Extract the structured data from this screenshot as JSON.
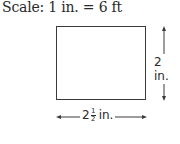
{
  "scale": {
    "text": "Scale: 1 in. = 6 ft"
  },
  "figure": {
    "shape": "rectangle",
    "height_label": "2 in.",
    "width_label": {
      "whole": "2",
      "numerator": "1",
      "denominator": "2",
      "unit": "in."
    }
  },
  "colors": {
    "line": "#3a3a3a",
    "text": "#2a2a2a",
    "background": "#ffffff"
  }
}
